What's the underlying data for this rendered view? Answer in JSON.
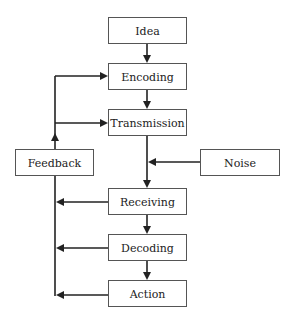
{
  "diagram": {
    "nodes": [
      {
        "id": "idea",
        "label": "Idea"
      },
      {
        "id": "encoding",
        "label": "Encoding"
      },
      {
        "id": "transmission",
        "label": "Transmission"
      },
      {
        "id": "feedback",
        "label": "Feedback"
      },
      {
        "id": "noise",
        "label": "Noise"
      },
      {
        "id": "receiving",
        "label": "Receiving"
      },
      {
        "id": "decoding",
        "label": "Decoding"
      },
      {
        "id": "action",
        "label": "Action"
      }
    ],
    "edges": [
      {
        "from": "idea",
        "to": "encoding"
      },
      {
        "from": "encoding",
        "to": "transmission"
      },
      {
        "from": "transmission",
        "to": "receiving"
      },
      {
        "from": "noise",
        "to": "transmission-receiving-link"
      },
      {
        "from": "receiving",
        "to": "decoding"
      },
      {
        "from": "decoding",
        "to": "action"
      },
      {
        "from": "receiving",
        "to": "feedback-line"
      },
      {
        "from": "decoding",
        "to": "feedback-line"
      },
      {
        "from": "action",
        "to": "feedback-line"
      },
      {
        "from": "feedback",
        "to": "encoding"
      },
      {
        "from": "feedback",
        "to": "transmission"
      }
    ],
    "colors": {
      "line": "#222222",
      "box_border": "#555555",
      "text": "#222222",
      "background": "#ffffff"
    }
  }
}
